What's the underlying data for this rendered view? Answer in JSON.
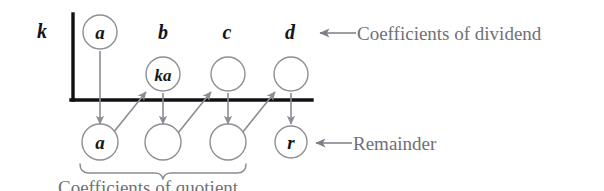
{
  "figure": {
    "divisor_label": "k",
    "top_row": {
      "name": "coefficients-of-dividend-row",
      "cells": [
        {
          "label": "a",
          "circled": true
        },
        {
          "label": "b",
          "circled": false
        },
        {
          "label": "c",
          "circled": false
        },
        {
          "label": "d",
          "circled": false
        }
      ]
    },
    "middle_row": {
      "name": "products-row",
      "cells": [
        {
          "label": "",
          "circled": false,
          "present": false
        },
        {
          "label": "ka",
          "circled": true,
          "present": true
        },
        {
          "label": "",
          "circled": true,
          "present": true
        },
        {
          "label": "",
          "circled": true,
          "present": true
        }
      ]
    },
    "bottom_row": {
      "name": "coefficients-of-quotient-row",
      "cells": [
        {
          "label": "a",
          "circled": true
        },
        {
          "label": "",
          "circled": true
        },
        {
          "label": "",
          "circled": true
        },
        {
          "label": "r",
          "circled": true
        }
      ]
    },
    "annotations": {
      "dividend": "Coefficients of dividend",
      "remainder": "Remainder",
      "quotient": "Coefficients of quotient"
    },
    "colors": {
      "ink": "#171717",
      "rule": "#111114",
      "circle_stroke": "#8d8f96",
      "annotation_text": "#6f7077",
      "arrow": "#8b8d94",
      "background": "#ffffff"
    }
  }
}
